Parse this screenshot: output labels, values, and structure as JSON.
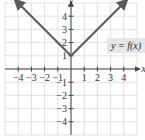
{
  "chart_data": {
    "type": "line",
    "title": "",
    "xlabel": "x",
    "ylabel": "y",
    "xlim": [
      -5,
      5
    ],
    "ylim": [
      -5,
      5
    ],
    "grid": true,
    "x_ticks": [
      -4,
      -3,
      -2,
      -1,
      1,
      2,
      3,
      4
    ],
    "y_ticks": [
      -4,
      -3,
      -2,
      -1,
      1,
      2,
      3,
      4
    ],
    "x_tick_labels": [
      "−4",
      "−3",
      "−2",
      "−1",
      "1",
      "2",
      "3",
      "4"
    ],
    "y_tick_labels": [
      "−4",
      "−3",
      "−2",
      "−1",
      "1",
      "2",
      "3",
      "4"
    ],
    "series": [
      {
        "name": "y = f(x)",
        "x": [
          -4,
          -3,
          -2,
          -1,
          0,
          1,
          2,
          3,
          4
        ],
        "y": [
          5,
          4,
          3,
          2,
          1,
          2,
          3,
          4,
          5
        ],
        "color": "#5a5a5a",
        "arrows": true
      }
    ],
    "annotations": [
      {
        "text": "y = f(x)",
        "position": "right of line near (3,3)"
      }
    ]
  },
  "labels": {
    "x_axis": "x",
    "y_axis": "y",
    "function": "y = f(x)"
  },
  "colors": {
    "curve": "#5a5a5a",
    "axis": "#444444",
    "grid": "#d9d9d9",
    "label_bg": "#e6e6e6"
  }
}
